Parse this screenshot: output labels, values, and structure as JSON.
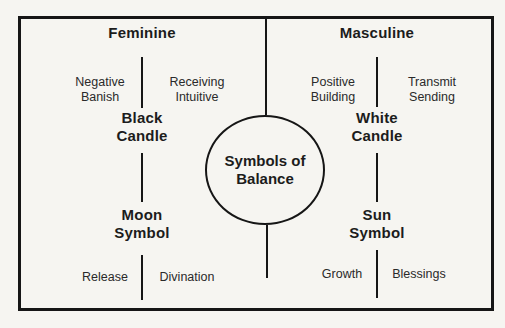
{
  "figure_title": "Symbols of Balance",
  "colors": {
    "ink": "#161616",
    "background": "#f6f5f1"
  },
  "center_circle": {
    "label": "Symbols of\nBalance"
  },
  "feminine": {
    "heading": "Feminine",
    "upper_left": "Negative\nBanish",
    "upper_right": "Receiving\nIntuitive",
    "symbol_upper": "Black\nCandle",
    "symbol_lower": "Moon\nSymbol",
    "bottom_left": "Release",
    "bottom_right": "Divination"
  },
  "masculine": {
    "heading": "Masculine",
    "upper_left": "Positive\nBuilding",
    "upper_right": "Transmit\nSending",
    "symbol_upper": "White\nCandle",
    "symbol_lower": "Sun\nSymbol",
    "bottom_left": "Growth",
    "bottom_right": "Blessings"
  }
}
